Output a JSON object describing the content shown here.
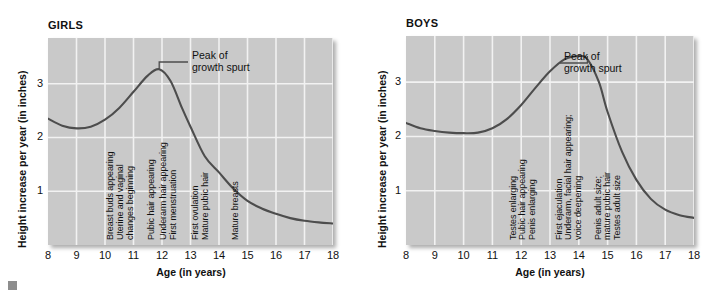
{
  "figure": {
    "corner_mark": "gray-square-bullet"
  },
  "charts": [
    {
      "id": "girls",
      "title": "GIRLS",
      "chart_data": {
        "type": "line",
        "title": "GIRLS",
        "xlabel": "Age (in years)",
        "ylabel": "Height increase per year (in inches)",
        "xlim": [
          8,
          18
        ],
        "ylim": [
          0,
          3.85
        ],
        "xticks": [
          8,
          9,
          10,
          11,
          12,
          13,
          14,
          15,
          16,
          17,
          18
        ],
        "yticks": [
          1,
          2,
          3
        ],
        "grid": true,
        "legend": "none",
        "series": [
          {
            "name": "Height velocity (girls)",
            "x": [
              8,
              8.5,
              9,
              9.5,
              10,
              10.5,
              11,
              11.5,
              11.9,
              12.3,
              12.7,
              13,
              13.5,
              14,
              14.5,
              15,
              15.5,
              16,
              16.5,
              17,
              17.5,
              18
            ],
            "values": [
              2.35,
              2.22,
              2.17,
              2.2,
              2.33,
              2.55,
              2.85,
              3.15,
              3.27,
              3.05,
              2.55,
              2.2,
              1.65,
              1.35,
              1.05,
              0.82,
              0.68,
              0.58,
              0.5,
              0.45,
              0.42,
              0.4
            ]
          }
        ],
        "annotations": [
          {
            "name": "peak-of-growth-spurt",
            "text": "Peak of growth spurt",
            "text_lines": [
              "Peak of",
              "growth spurt"
            ],
            "points_to_x": 11.9,
            "points_to_y": 3.27
          }
        ],
        "milestones": [
          {
            "label": "Breast buds appearing",
            "x": 10.1
          },
          {
            "label": "Uterine and vaginal",
            "x": 10.45
          },
          {
            "label": "changes beginning",
            "x": 10.8
          },
          {
            "label": "Pubic hair appearing",
            "x": 11.55
          },
          {
            "label": "Underarm hair appearing",
            "x": 11.95
          },
          {
            "label": "First menstruation",
            "x": 12.3
          },
          {
            "label": "First ovulation",
            "x": 13.1
          },
          {
            "label": "Mature pubic hair",
            "x": 13.45
          },
          {
            "label": "Mature breasts",
            "x": 14.5
          }
        ]
      }
    },
    {
      "id": "boys",
      "title": "BOYS",
      "chart_data": {
        "type": "line",
        "title": "BOYS",
        "xlabel": "Age (in years)",
        "ylabel": "Height increase per year (in inches)",
        "xlim": [
          8,
          18
        ],
        "ylim": [
          0,
          3.85
        ],
        "xticks": [
          8,
          9,
          10,
          11,
          12,
          13,
          14,
          15,
          16,
          17,
          18
        ],
        "yticks": [
          1,
          2,
          3
        ],
        "grid": true,
        "legend": "none",
        "series": [
          {
            "name": "Height velocity (boys)",
            "x": [
              8,
              8.5,
              9,
              9.5,
              10,
              10.5,
              11,
              11.5,
              12,
              12.5,
              13,
              13.5,
              14,
              14.3,
              14.7,
              15,
              15.5,
              16,
              16.5,
              17,
              17.5,
              18
            ],
            "values": [
              2.25,
              2.15,
              2.1,
              2.07,
              2.06,
              2.07,
              2.15,
              2.32,
              2.58,
              2.9,
              3.2,
              3.42,
              3.48,
              3.42,
              3.0,
              2.45,
              1.72,
              1.2,
              0.85,
              0.65,
              0.55,
              0.5
            ]
          }
        ],
        "annotations": [
          {
            "name": "peak-of-growth-spurt",
            "text": "Peak of growth spurt",
            "text_lines": [
              "Peak of",
              "growth spurt"
            ],
            "points_to_x": 14.3,
            "points_to_y": 3.48
          }
        ],
        "milestones": [
          {
            "label": "Testes enlarging",
            "x": 11.65
          },
          {
            "label": "Pubic hair appearing",
            "x": 11.95
          },
          {
            "label": "Penis enlarging",
            "x": 12.3
          },
          {
            "label": "First ejaculation",
            "x": 13.25
          },
          {
            "label": "Underarm, facial hair appearing;",
            "x": 13.55
          },
          {
            "label": "voice deepening",
            "x": 13.9
          },
          {
            "label": "Penis adult size;",
            "x": 14.6
          },
          {
            "label": "mature pubic hair",
            "x": 14.9
          },
          {
            "label": "Testes adult size",
            "x": 15.25
          }
        ]
      }
    }
  ]
}
